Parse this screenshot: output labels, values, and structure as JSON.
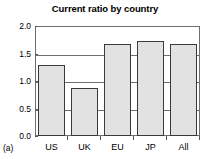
{
  "figure": {
    "panel_label": "(a)"
  },
  "chart_data": {
    "type": "bar",
    "title": "Current ratio by country",
    "xlabel": "",
    "ylabel": "",
    "categories": [
      "US",
      "UK",
      "EU",
      "JP",
      "All"
    ],
    "values": [
      1.3,
      0.88,
      1.68,
      1.72,
      1.68
    ],
    "ylim": [
      0.0,
      2.0
    ],
    "ytick_values": [
      0.0,
      0.5,
      1.0,
      1.5,
      2.0
    ],
    "ytick_labels": [
      "0.0",
      "0.5",
      "1.0",
      "1.5",
      "2.0"
    ],
    "gridlines": [
      0.5,
      1.0,
      1.5
    ],
    "grid": true,
    "legend": null,
    "legend_position": "none",
    "bar_fill_color": "#e2e2e2",
    "bar_edge_color": "#3a3a3a",
    "frame_color": "#6e6e6e",
    "background_color": "#ffffff"
  }
}
